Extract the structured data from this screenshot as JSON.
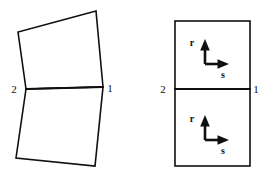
{
  "figure": {
    "background_color": "#ffffff",
    "stroke_color": "#101010",
    "width": 268,
    "height": 180
  },
  "left_panel": {
    "name": "physical-element-pair",
    "description": "Two distorted quadrilateral elements sharing edge 2-1",
    "shared_edge": {
      "start_label": "2",
      "end_label": "1",
      "start_point": [
        26,
        89
      ],
      "end_point": [
        103,
        87
      ]
    },
    "upper_element": {
      "name": "upper-quadrilateral",
      "points": "26,89 18,32 96,11 103,87"
    },
    "lower_element": {
      "name": "lower-quadrilateral",
      "points": "26,89 103,87 95,166 16,158"
    },
    "labels": [
      {
        "text": "2",
        "x": 14,
        "y": 93
      },
      {
        "text": "1",
        "x": 110,
        "y": 92
      }
    ]
  },
  "right_panel": {
    "name": "natural-coordinate-elements",
    "description": "Two reference rectangles each with local r-s axes",
    "rect_left": 175,
    "rect_right": 250,
    "rect_top": 21,
    "rect_bottom": 166,
    "rect_mid": 89,
    "shared_edge": {
      "start_label": "2",
      "end_label": "1",
      "start_point": [
        175,
        89
      ],
      "end_point": [
        250,
        89
      ]
    },
    "labels": [
      {
        "text": "2",
        "x": 163,
        "y": 93
      },
      {
        "text": "1",
        "x": 255,
        "y": 93
      }
    ],
    "axes": [
      {
        "name": "upper-rs-axes",
        "origin": [
          205,
          64
        ],
        "r_axis": {
          "label": "r",
          "tip": [
            205,
            41
          ],
          "label_x": 192,
          "label_y": 45
        },
        "s_axis": {
          "label": "s",
          "tip": [
            228,
            64
          ],
          "label_x": 222,
          "label_y": 77
        }
      },
      {
        "name": "lower-rs-axes",
        "origin": [
          205,
          140
        ],
        "r_axis": {
          "label": "r",
          "tip": [
            205,
            117
          ],
          "label_x": 192,
          "label_y": 121
        },
        "s_axis": {
          "label": "s",
          "tip": [
            228,
            140
          ],
          "label_x": 222,
          "label_y": 153
        }
      }
    ]
  }
}
